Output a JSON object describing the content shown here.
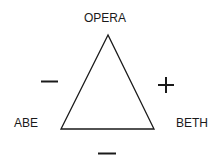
{
  "diagram": {
    "type": "balance-triangle",
    "nodes": {
      "top": {
        "label": "OPERA"
      },
      "left": {
        "label": "ABE"
      },
      "right": {
        "label": "BETH"
      }
    },
    "edges": {
      "left": {
        "from": "ABE",
        "to": "OPERA",
        "sign": "−"
      },
      "right": {
        "from": "BETH",
        "to": "OPERA",
        "sign": "+"
      },
      "bottom": {
        "from": "ABE",
        "to": "BETH",
        "sign": "−"
      }
    },
    "colors": {
      "stroke": "#1a1a1a",
      "background": "#ffffff"
    }
  }
}
